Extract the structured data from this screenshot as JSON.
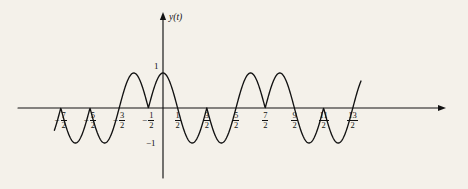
{
  "figure": {
    "background_color": "#f4f1ea",
    "ink_color": "#121212",
    "y_axis_label": "y(t)",
    "peak_label": "1",
    "trough_label": "−1"
  },
  "axes": {
    "x_tick_labels": [
      {
        "num": "7",
        "den": "2",
        "negative": true,
        "t": -3.5
      },
      {
        "num": "5",
        "den": "2",
        "negative": true,
        "t": -2.5
      },
      {
        "num": "3",
        "den": "2",
        "negative": true,
        "t": -1.5
      },
      {
        "num": "1",
        "den": "2",
        "negative": true,
        "t": -0.5
      },
      {
        "num": "1",
        "den": "2",
        "negative": false,
        "t": 0.5
      },
      {
        "num": "3",
        "den": "2",
        "negative": false,
        "t": 1.5
      },
      {
        "num": "5",
        "den": "2",
        "negative": false,
        "t": 2.5
      },
      {
        "num": "7",
        "den": "2",
        "negative": false,
        "t": 3.5
      },
      {
        "num": "9",
        "den": "2",
        "negative": false,
        "t": 4.5
      },
      {
        "num": "11",
        "den": "2",
        "negative": false,
        "t": 5.5
      },
      {
        "num": "13",
        "den": "2",
        "negative": false,
        "t": 6.5
      }
    ],
    "y_tick_labels": [
      "1",
      "−1"
    ],
    "x_range": [
      -4.2,
      7.6
    ],
    "y_range": [
      -1.25,
      1.45
    ],
    "grid": false,
    "x_axis_arrow": true,
    "y_axis_arrow": true
  },
  "chart_data": {
    "type": "line",
    "title": "",
    "xlabel": "",
    "ylabel": "y(t)",
    "xlim": [
      -4.2,
      7.6
    ],
    "ylim": [
      -1.25,
      1.45
    ],
    "grid": false,
    "legend": null,
    "x_tick_values": [
      -3.5,
      -2.5,
      -1.5,
      -0.5,
      0.5,
      1.5,
      2.5,
      3.5,
      4.5,
      5.5,
      6.5
    ],
    "x_tick_text": [
      "-7/2",
      "-5/2",
      "-3/2",
      "-1/2",
      "1/2",
      "3/2",
      "5/2",
      "7/2",
      "9/2",
      "11/2",
      "13/2"
    ],
    "y_tick_values": [
      1,
      -1
    ],
    "y_tick_text": [
      "1",
      "-1"
    ],
    "segments": [
      {
        "start": -3.5,
        "end": -2.5,
        "sign": -1,
        "peak_t": -3.0,
        "peak_y": -1
      },
      {
        "start": -2.5,
        "end": -1.5,
        "sign": -1,
        "peak_t": -2.0,
        "peak_y": -1
      },
      {
        "start": -1.5,
        "end": -0.5,
        "sign": 1,
        "peak_t": -1.0,
        "peak_y": 1
      },
      {
        "start": -0.5,
        "end": 0.5,
        "sign": 1,
        "peak_t": 0.0,
        "peak_y": 1
      },
      {
        "start": 0.5,
        "end": 1.5,
        "sign": -1,
        "peak_t": 1.0,
        "peak_y": -1
      },
      {
        "start": 1.5,
        "end": 2.5,
        "sign": -1,
        "peak_t": 2.0,
        "peak_y": -1
      },
      {
        "start": 2.5,
        "end": 3.5,
        "sign": 1,
        "peak_t": 3.0,
        "peak_y": 1
      },
      {
        "start": 3.5,
        "end": 4.5,
        "sign": 1,
        "peak_t": 4.0,
        "peak_y": 1
      },
      {
        "start": 4.5,
        "end": 5.5,
        "sign": -1,
        "peak_t": 5.0,
        "peak_y": -1
      },
      {
        "start": 5.5,
        "end": 6.5,
        "sign": -1,
        "peak_t": 6.0,
        "peak_y": -1
      },
      {
        "start": 6.5,
        "end": 6.78,
        "sign": 1,
        "peak_t": 7.0,
        "peak_y": 1
      }
    ],
    "amplitude": 1,
    "arc_half_period": 1
  },
  "geometry": {
    "origin_x_px": 163,
    "origin_y_px": 108,
    "unit_x_px": 29.2,
    "unit_y_px": 35,
    "x_axis_start_px": 18,
    "x_axis_end_px": 446,
    "y_axis_top_px": 12,
    "y_axis_bottom_px": 178,
    "curve_start_t": -3.72,
    "curve_end_t": 6.78
  }
}
